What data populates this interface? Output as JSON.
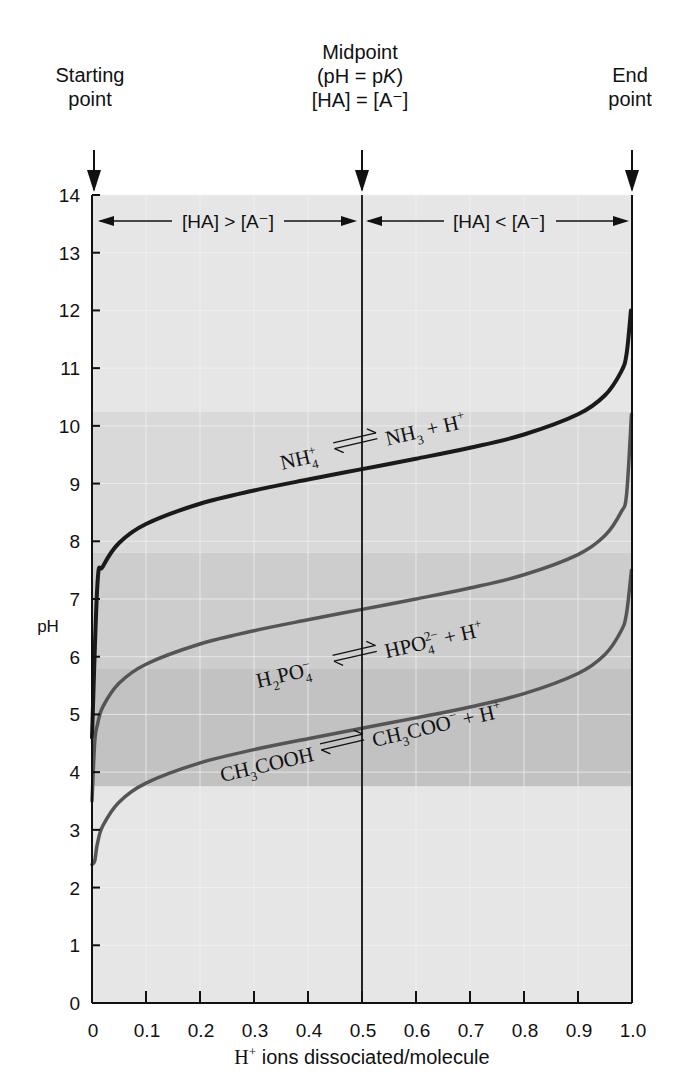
{
  "chart_data": {
    "type": "line",
    "title": "",
    "xlabel": "H⁺ ions dissociated/molecule",
    "ylabel": "pH",
    "xlim": [
      0,
      1.0
    ],
    "ylim": [
      0,
      14
    ],
    "x_ticks": [
      "0",
      "0.1",
      "0.2",
      "0.3",
      "0.4",
      "0.5",
      "0.6",
      "0.7",
      "0.8",
      "0.9",
      "1.0"
    ],
    "y_ticks": [
      "0",
      "1",
      "2",
      "3",
      "4",
      "5",
      "6",
      "7",
      "8",
      "9",
      "10",
      "11",
      "12",
      "13",
      "14"
    ],
    "grid": true,
    "legend": "none (inline curve labels)",
    "series": [
      {
        "name": "NH4+ ⇌ NH3 + H+",
        "pK": 9.25,
        "color": "#1a1a1a",
        "x": [
          0.0,
          0.01,
          0.02,
          0.05,
          0.1,
          0.2,
          0.3,
          0.4,
          0.5,
          0.6,
          0.7,
          0.8,
          0.9,
          0.95,
          0.98,
          0.99,
          0.998
        ],
        "y": [
          4.6,
          7.25,
          7.56,
          7.97,
          8.3,
          8.65,
          8.88,
          9.07,
          9.25,
          9.43,
          9.62,
          9.85,
          10.2,
          10.53,
          10.94,
          11.25,
          12.0
        ]
      },
      {
        "name": "H2PO4- ⇌ HPO4 2- + H+",
        "pK": 6.82,
        "color": "#555555",
        "x": [
          0.0,
          0.005,
          0.01,
          0.02,
          0.05,
          0.1,
          0.2,
          0.3,
          0.4,
          0.5,
          0.6,
          0.7,
          0.8,
          0.9,
          0.95,
          0.98,
          0.99,
          0.999
        ],
        "y": [
          3.5,
          4.52,
          4.82,
          5.13,
          5.54,
          5.87,
          6.22,
          6.45,
          6.64,
          6.82,
          7.0,
          7.19,
          7.42,
          7.77,
          8.1,
          8.51,
          8.82,
          10.2
        ]
      },
      {
        "name": "CH3COOH ⇌ CH3COO- + H+",
        "pK": 4.76,
        "color": "#555555",
        "x": [
          0.0,
          0.005,
          0.01,
          0.02,
          0.05,
          0.1,
          0.2,
          0.3,
          0.4,
          0.5,
          0.6,
          0.7,
          0.8,
          0.9,
          0.95,
          0.98,
          0.99,
          0.999
        ],
        "y": [
          2.4,
          2.46,
          2.76,
          3.07,
          3.48,
          3.81,
          4.16,
          4.39,
          4.58,
          4.76,
          4.94,
          5.13,
          5.36,
          5.71,
          6.04,
          6.45,
          6.76,
          7.5
        ]
      }
    ],
    "shaded_bands": [
      {
        "from": 10.25,
        "to": 14.0,
        "shade": "#e6e6e6"
      },
      {
        "from": 7.8,
        "to": 10.25,
        "shade": "#d9d9d9"
      },
      {
        "from": 5.8,
        "to": 7.8,
        "shade": "#cdcdcd"
      },
      {
        "from": 3.75,
        "to": 5.8,
        "shade": "#c2c2c2"
      },
      {
        "from": 0.0,
        "to": 3.75,
        "shade": "#e6e6e6"
      }
    ],
    "annotations": [
      {
        "text": "Starting point",
        "x": 0.0
      },
      {
        "text": "Midpoint (pH = pK) [HA] = [A⁻]",
        "x": 0.5
      },
      {
        "text": "End point",
        "x": 1.0
      },
      {
        "text": "[HA] > [A⁻]",
        "region": [
          0.0,
          0.5
        ],
        "y": 13.5
      },
      {
        "text": "[HA] < [A⁻]",
        "region": [
          0.5,
          1.0
        ],
        "y": 13.5
      }
    ]
  },
  "labels": {
    "start_line1": "Starting",
    "start_line2": "point",
    "mid_line1": "Midpoint",
    "mid_line2": "(pH = pK)",
    "mid_line3": "[HA] = [A⁻]",
    "end_line1": "End",
    "end_line2": "point",
    "region_left": "[HA] > [A⁻]",
    "region_right": "[HA] < [A⁻]",
    "ylabel": "pH",
    "xlabel_prefix": "H",
    "xlabel_sup": "+",
    "xlabel_suffix": " ions dissociated/molecule",
    "eq_nh4_left": "NH",
    "eq_nh4_left_sub": "4",
    "eq_nh4_left_sup": "+",
    "eq_nh4_right": "NH",
    "eq_nh4_right_sub": "3",
    "eq_nh4_tail": " + H",
    "eq_nh4_tail_sup": "+",
    "eq_po4_left": "H",
    "eq_po4_left_sub1": "2",
    "eq_po4_left_mid": "PO",
    "eq_po4_left_sub2": "4",
    "eq_po4_left_sup": "−",
    "eq_po4_right": "HPO",
    "eq_po4_right_sub": "4",
    "eq_po4_right_sup": "2−",
    "eq_po4_tail": " + H",
    "eq_po4_tail_sup": "+",
    "eq_ac_left": "CH",
    "eq_ac_left_sub": "3",
    "eq_ac_left_tail": "COOH",
    "eq_ac_right": "CH",
    "eq_ac_right_sub": "3",
    "eq_ac_right_tail": "COO",
    "eq_ac_right_sup": "−",
    "eq_ac_tail": " + H",
    "eq_ac_tail_sup": "+"
  },
  "colors": {
    "axis": "#111111",
    "grid": "#f4f4f4",
    "curve_dark": "#1a1a1a",
    "curve_gray": "#555555"
  }
}
